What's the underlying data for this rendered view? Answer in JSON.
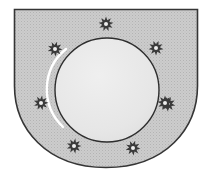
{
  "image": {
    "kind": "heraldic-coat-of-arms",
    "title": "Coat of arms",
    "width": 211,
    "height": 176,
    "background_color": "#ffffff"
  },
  "shield": {
    "name": "shield",
    "description": "Shield with straight top edge, square upper corners, vertical flanks and a rounded U-shaped base",
    "field_color": "#c9c9c9",
    "field_texture": "stipple-halftone",
    "outline_color": "#353535",
    "outline_width": 1.6,
    "geometry": {
      "left": 14,
      "right": 198,
      "top": 9,
      "bottom": 168,
      "straight_side_until_y": 86,
      "base_curve": "rounded"
    }
  },
  "charges": {
    "roundel": {
      "name": "circle",
      "description": "Large plain circle (roundel) centred on the field",
      "fill_color": "#e6e6e6",
      "outline_color": "#2e2e2e",
      "outline_width": 1.4,
      "highlight_color": "#ffffff",
      "highlight_width": 2.4,
      "cx": 107,
      "cy": 90,
      "r": 52
    },
    "stars": {
      "name": "stars",
      "count": 8,
      "description": "Eight small many-pointed stars (estoiles) set in orle around the circle",
      "point_count": 9,
      "fill_color": "#3a3a3a",
      "center_color": "#ededed",
      "outer_radius": 7.5,
      "inner_radius": 3.9,
      "center_radius": 2.0,
      "positions": [
        {
          "label": "star-top",
          "cx": 106,
          "cy": 24,
          "rotation": 0
        },
        {
          "label": "star-upper-left",
          "cx": 55,
          "cy": 49,
          "rotation": 14
        },
        {
          "label": "star-upper-right",
          "cx": 156,
          "cy": 48,
          "rotation": 20
        },
        {
          "label": "star-left",
          "cx": 41,
          "cy": 103,
          "rotation": 8
        },
        {
          "label": "star-right",
          "cx": 168,
          "cy": 104,
          "rotation": 22
        },
        {
          "label": "star-lower-left",
          "cx": 74,
          "cy": 146,
          "rotation": 10
        },
        {
          "label": "star-lower-right",
          "cx": 133,
          "cy": 148,
          "rotation": 16
        },
        {
          "label": "star-inner-right",
          "cx": 165,
          "cy": 103,
          "rotation": 0
        }
      ]
    }
  }
}
